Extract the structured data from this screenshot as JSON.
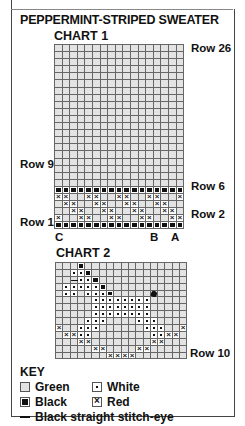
{
  "title": "PEPPERMINT-STRIPED SWEATER",
  "chart1": {
    "title": "CHART 1",
    "columns": 17,
    "rows": 26,
    "labels": {
      "row26": "Row 26",
      "row9": "Row 9",
      "row6": "Row 6",
      "row2": "Row 2",
      "row1": "Row 1",
      "colC": "C",
      "colB": "B",
      "colA": "A"
    },
    "pattern_rows_bottom_up": {
      "1": "BBBBBBBBBBBBBBBBB",
      "2": "X..XX..XX..XX..XX",
      "3": "..XX..XX..XX..XX.",
      "4": ".XX..XX..XX..XX..",
      "5": "XX..XX..XX..XX..X",
      "6": "BBBBBBBBBBBBBBBBB"
    },
    "fill_above": "green"
  },
  "chart2": {
    "title": "CHART 2",
    "columns": 18,
    "rows": 14,
    "labels": {
      "row10": "Row 10"
    },
    "rows_top_down": [
      "...B..............",
      "..WWB.............",
      "..EWWB............",
      ".WWWWWB...........",
      ".WW.WWWB.....F....",
      ".....WWWWWWWW.....",
      ".....WWWWWWWW.....",
      ".....WWWWWWWW.....",
      "....WWW....WWW....",
      "X..WWW......WWW..X",
      ".XXWW........WWXX.",
      "...XX........XX...",
      ".....XX....XX.....",
      ".......XXXX......."
    ]
  },
  "key": {
    "title": "KEY",
    "items": [
      {
        "symbol": "green",
        "label": "Green"
      },
      {
        "symbol": "white",
        "label": "White"
      },
      {
        "symbol": "black",
        "label": "Black"
      },
      {
        "symbol": "red",
        "label": "Red"
      },
      {
        "symbol": "dash",
        "label": "Black straight stitch-eye"
      }
    ]
  },
  "colors": {
    "green_cell": "#e3e3e3",
    "grid_line": "#666666",
    "ink": "#111111"
  }
}
